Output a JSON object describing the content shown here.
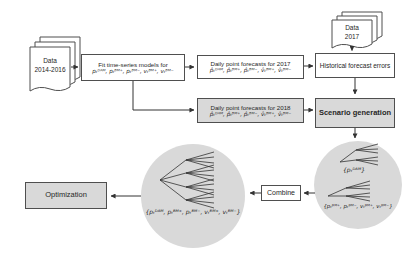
{
  "canvas": {
    "width": 417,
    "height": 258
  },
  "colors": {
    "background": "#ffffff",
    "box_border": "#4f4f4f",
    "gray_fill": "#d9d9d9",
    "white_fill": "#ffffff",
    "arrow": "#333333",
    "text": "#262626"
  },
  "nodes": {
    "data_2014_2016": {
      "line1": "Data",
      "line2": "2014-2016"
    },
    "data_2017": {
      "line1": "Data",
      "line2": "2017"
    },
    "fit_models": {
      "title": "Fit time-series models for",
      "formula": "pₜᴰᴬᴹ, pₜᴮᴹ⁺, pₜᴮᴹ⁻, vₜᴮᴹ⁺, vₜᴮᴹ⁻"
    },
    "forecasts_2017": {
      "title": "Daily point forecasts for 2017",
      "formula": "p̂ₜᴰᴬᴹ, p̂ₜᴮᴹ⁺, p̂ₜᴮᴹ⁻, v̂ₜᴮᴹ⁺, v̂ₜᴮᴹ⁻"
    },
    "forecasts_2018": {
      "title": "Daily point forecasts for 2018",
      "formula": "p̂ₜᴰᴬᴹ, p̂ₜᴮᴹ⁺, p̂ₜᴮᴹ⁻, v̂ₜᴮᴹ⁺, v̂ₜᴮᴹ⁻"
    },
    "historical_errors": {
      "label": "Historical forecast errors"
    },
    "scenario_generation": {
      "label": "Scenario generation"
    },
    "combine": {
      "label": "Combine"
    },
    "optimization": {
      "label": "Optimization"
    },
    "scenario_circle": {
      "caption_dam": "{pₜᴰᴬᴹ}",
      "caption_bm": "{pₜᴮᴹ⁺, pₜᴮᴹ⁻, vₜᴮᴹ⁺, vₜᴮᴹ⁻}"
    },
    "combined_circle": {
      "caption": "{pₜᴰᴬᴹ, pₜᴮᴹ⁺, pₜᴮᴹ⁻, vₜᴮᴹ⁺, vₜᴮᴹ⁻}"
    }
  }
}
